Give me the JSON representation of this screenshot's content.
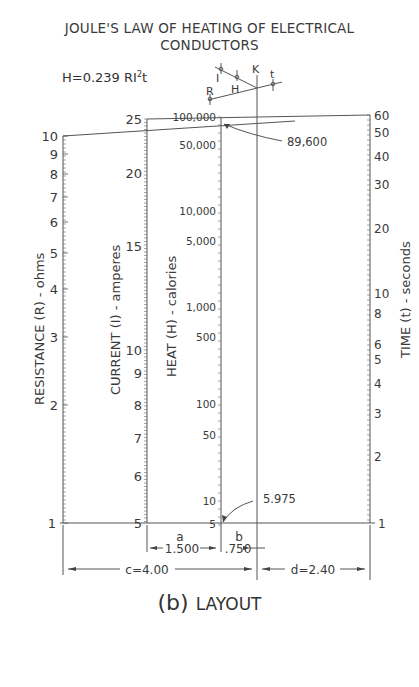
{
  "title": {
    "line1": "JOULE'S LAW OF HEATING OF ELECTRICAL",
    "line2": "CONDUCTORS"
  },
  "formula": {
    "text": "H=0.239 RI",
    "exponent": "2",
    "suffix": "t"
  },
  "key": {
    "labels": [
      "I",
      "H",
      "K",
      "R",
      "t"
    ]
  },
  "axes": {
    "resistance": {
      "label": "RESISTANCE (R) - ohms",
      "ticks": [
        "10",
        "9",
        "8",
        "7",
        "6",
        "5",
        "4",
        "3",
        "2",
        "1"
      ]
    },
    "current": {
      "label": "CURRENT (I) - amperes",
      "ticks": [
        "25",
        "20",
        "15",
        "10",
        "9",
        "8",
        "7",
        "6",
        "5"
      ]
    },
    "heat": {
      "label": "HEAT (H) - calories",
      "ticks": [
        "100,000",
        "50,000",
        "10,000",
        "5,000",
        "1,000",
        "500",
        "100",
        "50",
        "10",
        "5"
      ]
    },
    "time": {
      "label": "TIME (t) - seconds",
      "ticks": [
        "60",
        "50",
        "40",
        "30",
        "20",
        "10",
        "8",
        "6",
        "5",
        "4",
        "3",
        "2",
        "1"
      ]
    }
  },
  "annotations": {
    "upper_value": "89,600",
    "lower_value": "5.975"
  },
  "dimensions": {
    "a_label": "a",
    "a_value": "1.500",
    "b_label": "b",
    "b_value": ".750",
    "c": "c=4.00",
    "d": "d=2.40"
  },
  "caption": {
    "prefix": "(b)",
    "text": "LAYOUT"
  }
}
